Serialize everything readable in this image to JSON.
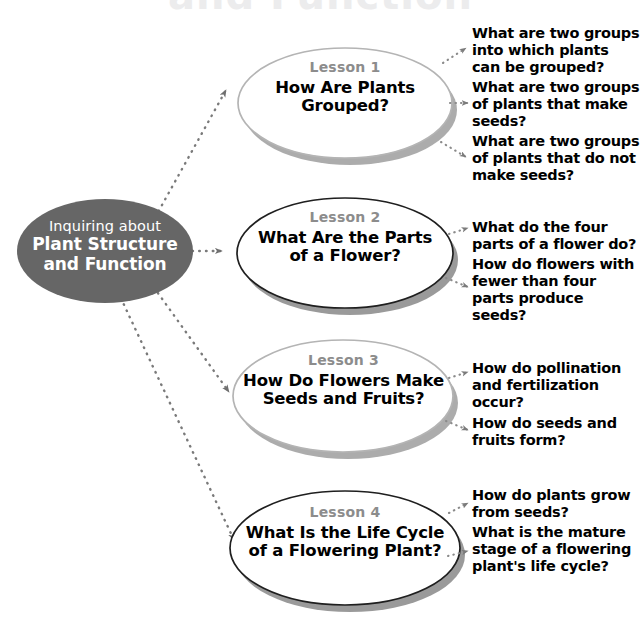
{
  "page": {
    "clipped_title": "and Function",
    "background_color": "#ffffff"
  },
  "colors": {
    "center_node_fill": "#666666",
    "center_node_text": "#ffffff",
    "lesson_label_text": "#8c8c8c",
    "lesson_title_text": "#000000",
    "question_text": "#000000",
    "connector": "#7a7a7a",
    "shadow": "#9a9a9a",
    "border_light": "#b4b4b4",
    "border_dark": "#1a1a1a"
  },
  "center_node": {
    "line1": "Inquiring about",
    "line2": "Plant Structure",
    "line3": "and Function"
  },
  "lessons": [
    {
      "label": "Lesson 1",
      "title_line1": "How Are Plants",
      "title_line2": "Grouped?",
      "border_style": "light",
      "questions": [
        "What are two groups into which plants can be grouped?",
        "What are two groups of plants that make seeds?",
        "What are two groups of plants that do not make seeds?"
      ]
    },
    {
      "label": "Lesson 2",
      "title_line1": "What Are the Parts",
      "title_line2": "of a Flower?",
      "border_style": "dark",
      "questions": [
        "What do the four parts of a flower do?",
        "How do flowers with fewer than four parts produce seeds?"
      ]
    },
    {
      "label": "Lesson 3",
      "title_line1": "How Do Flowers Make",
      "title_line2": "Seeds and Fruits?",
      "border_style": "light",
      "questions": [
        "How do pollination and fertilization occur?",
        "How do seeds and fruits form?"
      ]
    },
    {
      "label": "Lesson 4",
      "title_line1": "What Is the Life Cycle",
      "title_line2": "of a Flowering Plant?",
      "border_style": "dark",
      "questions": [
        "How do plants grow from seeds?",
        "What is the mature stage of a flowering plant's life cycle?"
      ]
    }
  ]
}
